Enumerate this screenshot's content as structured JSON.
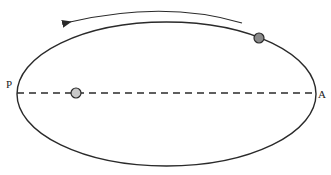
{
  "diagram": {
    "type": "elliptical-orbit",
    "labels": {
      "perihelion": "P",
      "aphelion": "A"
    },
    "colors": {
      "orbit": "#2a2a2a",
      "focus_body": "#c8c8c8",
      "orbiting_body": "#8a8a8a",
      "axis": "#2a2a2a",
      "arrow": "#2a2a2a"
    },
    "elements": {
      "orbit": "ellipse orbit",
      "major_axis": "dashed major axis from P to A",
      "focus_body": "light gray body at focus",
      "orbiting_body": "dark gray body on orbit",
      "direction_arrow": "arrow indicating counter-clockwise motion"
    }
  }
}
